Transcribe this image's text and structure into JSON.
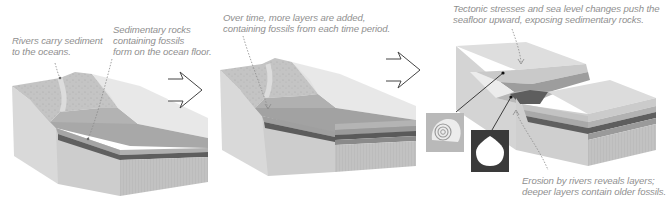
{
  "diagram": {
    "panels": [
      {
        "id": "panel-1",
        "captions": [
          {
            "id": "rivers",
            "text": "Rivers carry sediment\nto the oceans."
          },
          {
            "id": "sedimentary",
            "text": "Sedimentary rocks\ncontaining fossils\nform on the ocean floor."
          }
        ]
      },
      {
        "id": "panel-2",
        "captions": [
          {
            "id": "over-time",
            "text": "Over time, more layers are added,\ncontaining fossils from each time period."
          }
        ]
      },
      {
        "id": "panel-3",
        "captions": [
          {
            "id": "tectonic",
            "text": "Tectonic stresses and sea level changes push the\nseafloor upward, exposing sedimentary rocks."
          },
          {
            "id": "erosion",
            "text": "Erosion by rivers reveals layers;\ndeeper layers contain older fossils."
          }
        ],
        "fossils": [
          {
            "id": "ammonite",
            "label": "spiral-shell fossil",
            "background": "#b9b9b9"
          },
          {
            "id": "clam",
            "label": "bivalve-shell fossil",
            "background": "#3a3a3a"
          }
        ]
      }
    ],
    "arrows": [
      {
        "id": "arrow-1",
        "direction": "right"
      },
      {
        "id": "arrow-2",
        "direction": "right"
      }
    ],
    "colors": {
      "caption_text": "#8f8f8f",
      "leader_line": "#8a8a8a",
      "land_top": "#c8c8c8",
      "block_side": "#d6d6d6",
      "water": "#e4e4e4",
      "sediment_light": "#bdbdbd",
      "sediment_mid": "#a9a9a9",
      "sediment_dark": "#6f6f6f",
      "bedrock": "#c3c3c3"
    }
  }
}
